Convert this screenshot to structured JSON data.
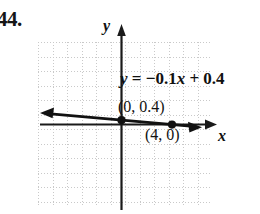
{
  "exercise": {
    "number": "44."
  },
  "figure": {
    "name": "coordinate-plane-linear-graph",
    "axes": {
      "x_label": "x",
      "y_label": "y",
      "x_arrow_direction": "right",
      "y_arrow_direction": "up"
    },
    "grid": {
      "visible": true,
      "style": "dotted",
      "color": "#c9c9c9",
      "cell_size_px": 14.5,
      "columns": 12,
      "rows": 11
    },
    "equation_label": {
      "full": "y = -0.1x + 0.4",
      "lhs": "y",
      "equals": " = ",
      "rhs_prefix": "−0.1",
      "rhs_var": "x",
      "rhs_suffix": " + 0.4"
    },
    "points": [
      {
        "name": "y-intercept-point",
        "label": "(0, 0.4)",
        "x": 0,
        "y": 0.4
      },
      {
        "name": "x-intercept-point",
        "label": "(4, 0)",
        "x": 4,
        "y": 0
      }
    ],
    "line": {
      "name": "graphed-line",
      "slope": -0.1,
      "intercept": 0.4,
      "color": "#111111",
      "arrow_left": true,
      "arrow_right": true
    }
  },
  "chart_data": {
    "type": "line",
    "title": "",
    "xlabel": "x",
    "ylabel": "y",
    "equation": "y = -0.1x + 0.4",
    "slope": -0.1,
    "y_intercept": 0.4,
    "x_intercept": 4,
    "series": [
      {
        "name": "y = -0.1x + 0.4",
        "points": [
          {
            "x": 0,
            "y": 0.4,
            "labeled": true,
            "label": "(0, 0.4)"
          },
          {
            "x": 4,
            "y": 0,
            "labeled": true,
            "label": "(4, 0)"
          }
        ]
      }
    ],
    "xlim": [
      -5.7,
      6.3
    ],
    "ylim": [
      -5.8,
      5.2
    ],
    "grid": true,
    "legend": false,
    "annotations": [
      "y = -0.1x + 0.4",
      "(0, 0.4)",
      "(4, 0)"
    ]
  }
}
